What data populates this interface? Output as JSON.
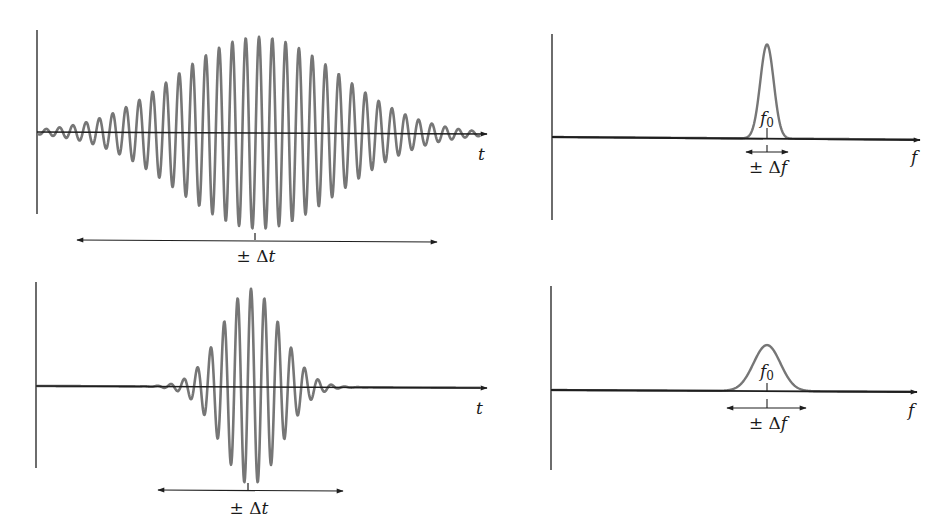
{
  "chart_data": [
    {
      "type": "line",
      "id": "long-pulse-time",
      "title": "",
      "description": "Long wave packet in time domain: Gaussian-enveloped sinusoid (many cycles)",
      "xlabel": "t",
      "ylabel": "",
      "width_label": "± Δt",
      "carrier_period_px": 13.3,
      "envelope": "gaussian",
      "center_px": 259,
      "span_px": [
        50,
        480
      ],
      "grid": false
    },
    {
      "type": "line",
      "id": "narrow-spectrum",
      "title": "",
      "description": "Narrow spectral peak centered at f0",
      "xlabel": "f",
      "ylabel": "",
      "peak_label": "f0",
      "width_label": "± Δf",
      "peak_center_px": 767,
      "peak_base_px": [
        747,
        788
      ],
      "grid": false
    },
    {
      "type": "line",
      "id": "short-pulse-time",
      "title": "",
      "description": "Short wave packet in time domain: Gaussian-enveloped sinusoid (fewer cycles)",
      "xlabel": "t",
      "ylabel": "",
      "width_label": "± Δt",
      "carrier_period_px": 13.4,
      "envelope": "gaussian",
      "center_px": 251,
      "span_px": [
        150,
        358
      ],
      "grid": false
    },
    {
      "type": "line",
      "id": "wide-spectrum",
      "title": "",
      "description": "Broader spectral peak centered at f0",
      "xlabel": "f",
      "ylabel": "",
      "peak_label": "f0",
      "width_label": "± Δf",
      "peak_center_px": 767,
      "peak_base_px": [
        727,
        806
      ],
      "grid": false
    }
  ],
  "panels": {
    "top_left": {
      "axis_label": "t",
      "width_label_prefix": "± Δ",
      "width_label_var": "t"
    },
    "top_right": {
      "axis_label": "f",
      "peak_label_var": "f",
      "peak_label_sub": "0",
      "width_label_prefix": "± Δ",
      "width_label_var": "f"
    },
    "bottom_left": {
      "axis_label": "t",
      "width_label_prefix": "± Δ",
      "width_label_var": "t"
    },
    "bottom_right": {
      "axis_label": "f",
      "peak_label_var": "f",
      "peak_label_sub": "0",
      "width_label_prefix": "± Δ",
      "width_label_var": "f"
    }
  },
  "colors": {
    "axis": "#1e1e1e",
    "wave": "#767676",
    "background": "#ffffff"
  }
}
